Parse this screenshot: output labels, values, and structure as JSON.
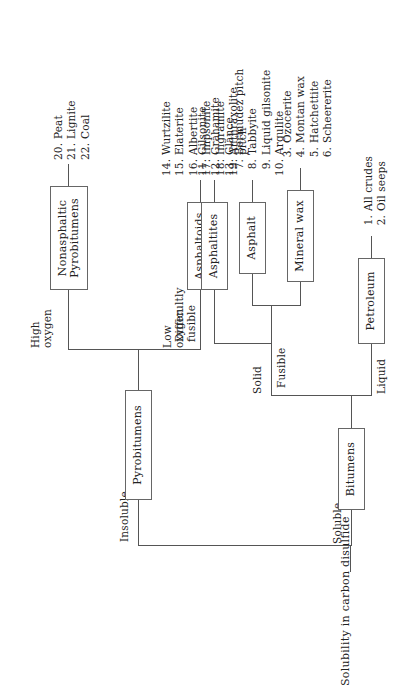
{
  "title": "Solubility in carbon disulfide",
  "nodes": {
    "pyrobitumens": "Pyrobitumens",
    "bitumens": "Bitumens",
    "petroleum": "Petroleum",
    "mineral_wax": "Mineral wax",
    "asphalt": "Asphalt",
    "asphaltites": "Asphaltites",
    "asphaltoids": "Asphaltoids",
    "nonasphaltic": "Nonasphaltic\nPyrobitumens"
  },
  "edges": {
    "insoluble": "Insoluble",
    "soluble": "Soluble",
    "liquid": "Liquid",
    "solid": "Solid",
    "fusible": "Fusible",
    "difficultly_fusible": "Difficultly\nfusible",
    "low_oxygen": "Low\noxygen",
    "high_oxygen": "High\noxygen"
  },
  "lists": {
    "petroleum": [
      {
        "n": "1.",
        "t": "All crudes"
      },
      {
        "n": "2.",
        "t": "Oil seeps"
      }
    ],
    "mineral_wax": [
      {
        "n": "3.",
        "t": "Ozocerite"
      },
      {
        "n": "4.",
        "t": "Montan wax"
      },
      {
        "n": "5.",
        "t": "Hatchettite"
      },
      {
        "n": "6.",
        "t": "Scheererite"
      }
    ],
    "asphalt": [
      {
        "n": "7.",
        "t": "Bermudez pitch"
      },
      {
        "n": "8.",
        "t": "Tabbyite"
      },
      {
        "n": "9.",
        "t": "Liquid gilsonite"
      },
      {
        "n": "10.",
        "t": "Argulite"
      }
    ],
    "asphaltites": [
      {
        "n": "11.",
        "t": "Gilsonite"
      },
      {
        "n": "12.",
        "t": "Grahamite"
      },
      {
        "n": "13.",
        "t": "Glance\n   pitch"
      }
    ],
    "asphaltoids": [
      {
        "n": "14.",
        "t": "Wurtzilite"
      },
      {
        "n": "15.",
        "t": "Elaterite"
      },
      {
        "n": "16.",
        "t": "Albertite"
      },
      {
        "n": "17.",
        "t": "Impsonite"
      },
      {
        "n": "18.",
        "t": "Ingramite"
      },
      {
        "n": "19.",
        "t": "Anthraxolite"
      }
    ],
    "nonasphaltic": [
      {
        "n": "20.",
        "t": "Peat"
      },
      {
        "n": "21.",
        "t": "Lignite"
      },
      {
        "n": "22.",
        "t": "Coal"
      }
    ]
  },
  "colors": {
    "background": "#ffffff",
    "stroke": "#555555",
    "text": "#222222",
    "box_border": "#666666"
  }
}
